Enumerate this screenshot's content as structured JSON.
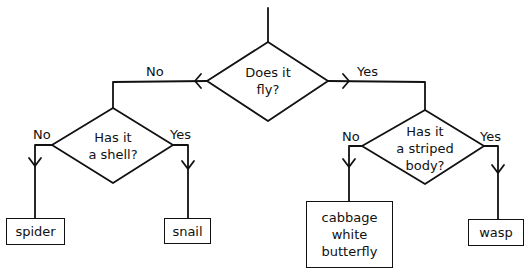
{
  "diagram": {
    "type": "decision-tree-flowchart",
    "root": {
      "question": [
        "Does it",
        "fly?"
      ],
      "no_label": "No",
      "yes_label": "Yes"
    },
    "left_decision": {
      "question": [
        "Has it",
        "a shell?"
      ],
      "no_label": "No",
      "yes_label": "Yes",
      "no_result": "spider",
      "yes_result": "snail"
    },
    "right_decision": {
      "question": [
        "Has it",
        "a striped",
        "body?"
      ],
      "no_label": "No",
      "yes_label": "Yes",
      "no_result": [
        "cabbage",
        "white",
        "butterfly"
      ],
      "yes_result": "wasp"
    }
  }
}
